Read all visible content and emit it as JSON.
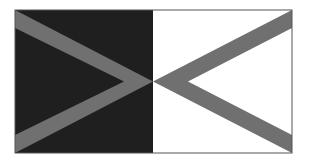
{
  "figure": {
    "frame": {
      "x": 15,
      "y": 10,
      "width": 277,
      "height": 143
    },
    "divider_x": 153,
    "center_y": 81,
    "band_width": 15,
    "colors": {
      "left_fill": "#1f1f1f",
      "right_fill": "#ffffff",
      "chevron": "#707070",
      "border": "#555555"
    },
    "shapes": {
      "left_chevron": "right-pointing chevron (>)",
      "right_chevron": "left-pointing chevron (<)"
    }
  }
}
